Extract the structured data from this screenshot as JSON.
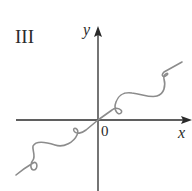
{
  "figure": {
    "panel_label": "III",
    "axes": {
      "x_label": "x",
      "y_label": "y",
      "origin_label": "0"
    },
    "colors": {
      "axis": "#2a2a2a",
      "curve": "#8c8c8c",
      "background": "#ffffff"
    },
    "curve_description": "Wavy curve through origin with small loops, increasing overall from lower-left to upper-right"
  }
}
